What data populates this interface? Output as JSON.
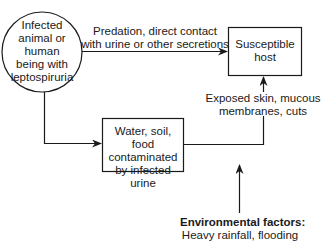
{
  "nodes": {
    "source": {
      "shape": "circle",
      "lines": [
        "Infected",
        "animal or",
        "human",
        "being with",
        "leptospiruria"
      ]
    },
    "host": {
      "shape": "rectangle",
      "lines": [
        "Susceptible",
        "host"
      ]
    },
    "environment": {
      "shape": "rectangle",
      "lines": [
        "Water, soil, food",
        "contaminated",
        "by infected urine"
      ]
    }
  },
  "edges": {
    "direct": {
      "from": "source",
      "to": "host",
      "lines": [
        "Predation, direct contact",
        "with urine or other secretions"
      ]
    },
    "to_environment": {
      "from": "source",
      "to": "environment"
    },
    "indirect": {
      "from": "environment",
      "to": "host",
      "lines": [
        "Exposed skin, mucous",
        "membranes, cuts"
      ]
    }
  },
  "factors": {
    "title": "Environmental factors:",
    "detail": "Heavy rainfall, flooding"
  },
  "colors": {
    "stroke": "#1a1a1a",
    "background": "#ffffff"
  }
}
